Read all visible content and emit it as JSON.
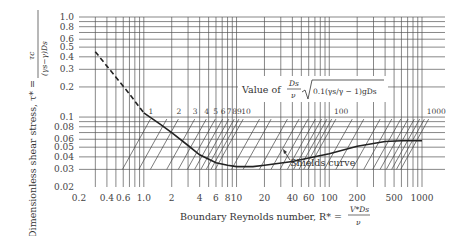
{
  "chart_data": {
    "type": "line",
    "title": "",
    "xlabel": "Boundary Reynolds number, R* = V*Ds / ν",
    "ylabel": "Dimensionless shear stress, τ* = τc / ((γs − γ) Ds)",
    "xscale": "log",
    "yscale": "log",
    "xlim": [
      0.2,
      1000
    ],
    "ylim": [
      0.02,
      1.0
    ],
    "grid": true,
    "x_ticks": [
      "0.2",
      "0.4",
      "0.6",
      "1.0",
      "2",
      "4",
      "6",
      "8",
      "10",
      "20",
      "40",
      "60",
      "100",
      "200",
      "500",
      "1000"
    ],
    "y_ticks": [
      "1.0",
      "0.8",
      "0.6",
      "0.5",
      "0.4",
      "0.3",
      "0.2",
      "0.1",
      "0.08",
      "0.06",
      "0.05",
      "0.04",
      "0.03",
      "0.02"
    ],
    "series": [
      {
        "name": "Shields curve (extrapolated, dashed)",
        "style": "dashed",
        "x": [
          0.3,
          0.5,
          0.7,
          1.0
        ],
        "y": [
          0.45,
          0.25,
          0.17,
          0.11
        ]
      },
      {
        "name": "Shields curve",
        "style": "solid",
        "x": [
          1.0,
          1.5,
          2,
          3,
          4,
          6,
          8,
          10,
          15,
          20,
          40,
          60,
          100,
          200,
          400,
          600,
          1000
        ],
        "y": [
          0.11,
          0.085,
          0.07,
          0.052,
          0.042,
          0.035,
          0.033,
          0.032,
          0.032,
          0.033,
          0.036,
          0.039,
          0.043,
          0.051,
          0.057,
          0.058,
          0.058
        ]
      }
    ],
    "diagonal_scale": {
      "label": "Value of (Ds/ν) √(0.1 (γs/γ − 1) g Ds)",
      "markers": [
        "1",
        "2",
        "3",
        "4",
        "5",
        "6",
        "7",
        "8",
        "9",
        "10",
        "100",
        "1000"
      ]
    },
    "annotations": [
      {
        "text": "Shields curve",
        "x": 40,
        "y": 0.028
      }
    ]
  },
  "labels": {
    "y_axis": "Dimensionless shear stress, τ* =",
    "y_frac_num": "τc",
    "y_frac_den": "(γs−γ)Ds",
    "x_axis": "Boundary Reynolds number, R* =",
    "x_frac_num": "V*Ds",
    "x_frac_den": "ν",
    "param_prefix": "Value of",
    "param_frac_num": "Ds",
    "param_frac_den": "ν",
    "param_sqrt": "0.1(γs/γ − 1)gDs",
    "curve_label": "Shields curve"
  }
}
